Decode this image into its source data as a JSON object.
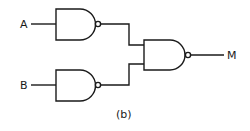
{
  "diagram": {
    "type": "logic-circuit",
    "caption": "(b)",
    "inputs": [
      {
        "label": "A"
      },
      {
        "label": "B"
      }
    ],
    "output": {
      "label": "M"
    },
    "gates": [
      {
        "id": "gate-1",
        "type": "NAND",
        "inputs": [
          "A"
        ],
        "output_to": "gate-3"
      },
      {
        "id": "gate-2",
        "type": "NAND",
        "inputs": [
          "B"
        ],
        "output_to": "gate-3"
      },
      {
        "id": "gate-3",
        "type": "NAND",
        "inputs": [
          "gate-1",
          "gate-2"
        ],
        "output": "M"
      }
    ],
    "colors": {
      "line": "#1a1a1a",
      "background": "#ffffff"
    }
  }
}
